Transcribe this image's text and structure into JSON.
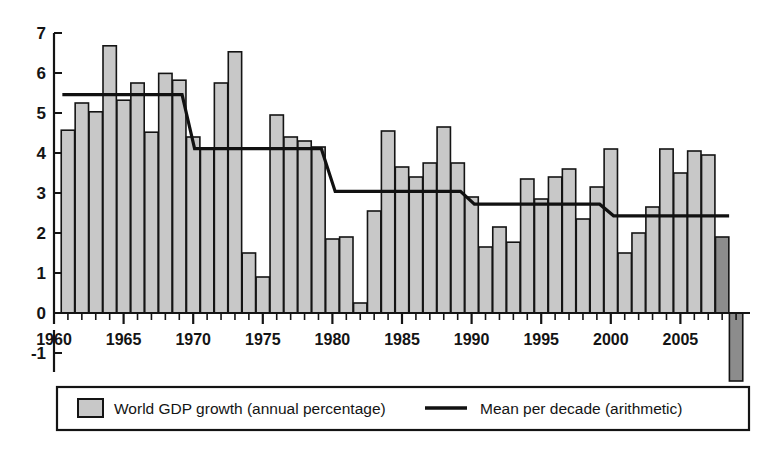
{
  "chart_data": {
    "type": "bar",
    "title": "",
    "subtitle": "",
    "xlabel": "",
    "ylabel": "",
    "ylim": [
      -2.0,
      7.0
    ],
    "xlim": [
      1960.0,
      2010.0
    ],
    "grid": false,
    "y_ticks": [
      "7",
      "6",
      "5",
      "4",
      "3",
      "2",
      "1",
      "0",
      "-1"
    ],
    "y_tick_values": [
      7,
      6,
      5,
      4,
      3,
      2,
      1,
      0,
      -1
    ],
    "x_ticks": [
      "1960",
      "1965",
      "1970",
      "1975",
      "1980",
      "1985",
      "1990",
      "1995",
      "2000",
      "2005"
    ],
    "x_tick_values": [
      1960,
      1965,
      1970,
      1975,
      1980,
      1985,
      1990,
      1995,
      2000,
      2005
    ],
    "categories": [
      1961,
      1962,
      1963,
      1964,
      1965,
      1966,
      1967,
      1968,
      1969,
      1970,
      1971,
      1972,
      1973,
      1974,
      1975,
      1976,
      1977,
      1978,
      1979,
      1980,
      1981,
      1982,
      1983,
      1984,
      1985,
      1986,
      1987,
      1988,
      1989,
      1990,
      1991,
      1992,
      1993,
      1994,
      1995,
      1996,
      1997,
      1998,
      1999,
      2000,
      2001,
      2002,
      2003,
      2004,
      2005,
      2006,
      2007,
      2008,
      2009
    ],
    "values": [
      4.57,
      5.25,
      5.03,
      6.68,
      5.32,
      5.75,
      4.52,
      5.99,
      5.82,
      4.4,
      4.1,
      5.75,
      6.53,
      1.5,
      0.9,
      4.95,
      4.4,
      4.3,
      4.15,
      1.85,
      1.9,
      0.25,
      2.55,
      4.55,
      3.65,
      3.4,
      3.75,
      4.65,
      3.75,
      2.9,
      1.65,
      2.15,
      1.77,
      3.35,
      2.85,
      3.4,
      3.6,
      2.35,
      3.15,
      4.1,
      1.5,
      2.0,
      2.65,
      4.1,
      3.5,
      4.05,
      3.95,
      1.9,
      -1.7
    ],
    "bar_colors": {
      "default": "#c8c8c8",
      "highlight": "#8c8c8c"
    },
    "highlighted_categories": [
      2008,
      2009
    ],
    "series": [
      {
        "name": "World GDP growth (annual percentage)",
        "type": "bar",
        "values": [
          4.57,
          5.25,
          5.03,
          6.68,
          5.32,
          5.75,
          4.52,
          5.99,
          5.82,
          4.4,
          4.1,
          5.75,
          6.53,
          1.5,
          0.9,
          4.95,
          4.4,
          4.3,
          4.15,
          1.85,
          1.9,
          0.25,
          2.55,
          4.55,
          3.65,
          3.4,
          3.75,
          4.65,
          3.75,
          2.9,
          1.65,
          2.15,
          1.77,
          3.35,
          2.85,
          3.4,
          3.6,
          2.35,
          3.15,
          4.1,
          1.5,
          2.0,
          2.65,
          4.1,
          3.5,
          4.05,
          3.95,
          1.9,
          -1.7
        ]
      },
      {
        "name": "Mean per decade (arithmetic)",
        "type": "step-line",
        "segments": [
          {
            "decade": "1960s",
            "x_start": 1960.6,
            "x_end": 1969.2,
            "value": 5.46
          },
          {
            "decade": "1970s",
            "x_start": 1970.1,
            "x_end": 1979.2,
            "value": 4.11
          },
          {
            "decade": "1980s",
            "x_start": 1980.2,
            "x_end": 1989.2,
            "value": 3.04
          },
          {
            "decade": "1990s",
            "x_start": 1990.2,
            "x_end": 1999.2,
            "value": 2.72
          },
          {
            "decade": "2000s",
            "x_start": 2000.2,
            "x_end": 2008.5,
            "value": 2.43
          }
        ]
      }
    ],
    "legend": {
      "position": "bottom",
      "entries": [
        {
          "label": "World GDP growth (annual percentage)",
          "marker": "filled-square-swatch",
          "color": "#c8c8c8"
        },
        {
          "label": "Mean per decade (arithmetic)",
          "marker": "line-swatch",
          "color": "#111111"
        }
      ]
    }
  }
}
